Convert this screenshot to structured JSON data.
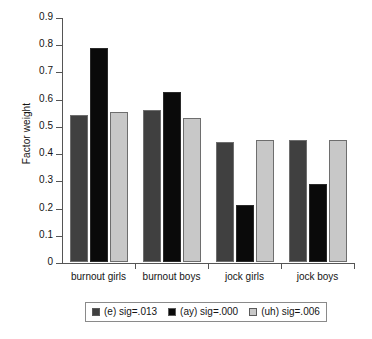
{
  "chart_data": {
    "type": "bar",
    "title": "",
    "xlabel": "",
    "ylabel": "Factor weight",
    "ylim": [
      0,
      0.9
    ],
    "ytick_labels": [
      "0.9",
      "0.8",
      "0.7",
      "0.6",
      "0.5",
      "0.4",
      "0.3",
      "0.2",
      "0.1",
      "0"
    ],
    "ytick_values": [
      0.9,
      0.8,
      0.7,
      0.6,
      0.5,
      0.4,
      0.3,
      0.2,
      0.1,
      0
    ],
    "grid": false,
    "legend_position": "bottom",
    "categories": [
      "burnout girls",
      "burnout boys",
      "jock girls",
      "jock boys"
    ],
    "series": [
      {
        "name": "(e) sig=.013",
        "color": "#404040",
        "values": [
          0.54,
          0.56,
          0.44,
          0.45
        ]
      },
      {
        "name": "(ay) sig=.000",
        "color": "#0a0a0a",
        "values": [
          0.785,
          0.625,
          0.21,
          0.285
        ]
      },
      {
        "name": "(uh) sig=.006",
        "color": "#c8c8c8",
        "values": [
          0.55,
          0.53,
          0.45,
          0.45
        ]
      }
    ]
  },
  "axis": {
    "y_title": "Factor weight"
  },
  "legend": {
    "entries": [
      {
        "label": "(e) sig=.013",
        "swatch": "#404040"
      },
      {
        "label": "(ay) sig=.000",
        "swatch": "#0a0a0a"
      },
      {
        "label": "(uh) sig=.006",
        "swatch": "#c8c8c8"
      }
    ]
  }
}
